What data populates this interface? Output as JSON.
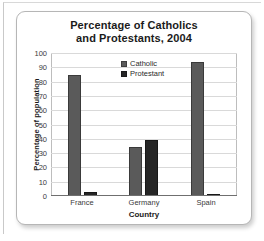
{
  "chart_data": {
    "type": "bar",
    "title": "Percentage of Catholics and Protestants, 2004",
    "title_line1": "Percentage of Catholics",
    "title_line2": "and Protestants, 2004",
    "xlabel": "Country",
    "ylabel": "Percentage of population",
    "categories": [
      "France",
      "Germany",
      "Spain"
    ],
    "series": [
      {
        "name": "Catholic",
        "color": "#5a5a5a",
        "values": [
          85,
          34,
          94
        ]
      },
      {
        "name": "Protestant",
        "color": "#262626",
        "values": [
          2,
          39,
          1
        ]
      }
    ],
    "ylim": [
      0,
      100
    ],
    "yticks": [
      100,
      90,
      80,
      70,
      60,
      50,
      40,
      30,
      20,
      10,
      0
    ],
    "grid": true,
    "legend_position": "inside-top-center"
  }
}
